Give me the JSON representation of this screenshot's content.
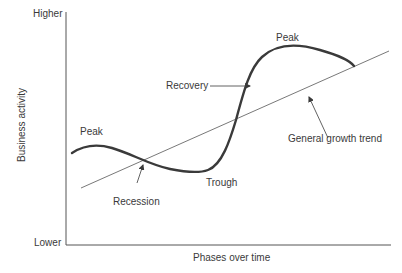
{
  "diagram": {
    "title_fragment": "",
    "y_axis": {
      "label": "Business activity",
      "top_label": "Higher",
      "bottom_label": "Lower"
    },
    "x_axis": {
      "label": "Phases over time"
    },
    "annotations": {
      "peak_left": "Peak",
      "peak_right": "Peak",
      "recovery": "Recovery",
      "recession": "Recession",
      "trough": "Trough",
      "trend": "General growth trend"
    },
    "colors": {
      "curve": "#3a3a3a",
      "trend_line": "#555555",
      "axis": "#555555",
      "text": "#3a3a3a"
    }
  }
}
